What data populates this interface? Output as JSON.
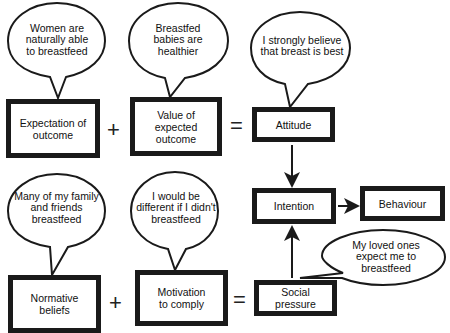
{
  "diagram": {
    "type": "theory-of-reasoned-action",
    "boxes": {
      "expectation": "Expectation of outcome",
      "value": "Value of expected outcome",
      "attitude": "Attitude",
      "intention": "Intention",
      "behaviour": "Behaviour",
      "normative": "Normative beliefs",
      "motivation": "Motivation to comply",
      "social": "Social pressure"
    },
    "bubbles": {
      "expectation": "Women are naturally able to breastfeed",
      "value": "Breastfed babies are healthier",
      "attitude": "I strongly believe that breast is best",
      "normative": "Many of my family and friends breastfeed",
      "motivation": "I would be different if I didn't breastfeed",
      "social": "My loved ones expect me to breastfeed"
    },
    "operators": {
      "plus_top": "+",
      "equals_top": "=",
      "plus_bottom": "+",
      "equals_bottom": "="
    },
    "edges": [
      {
        "from": "Attitude",
        "to": "Intention"
      },
      {
        "from": "Social pressure",
        "to": "Intention"
      },
      {
        "from": "Intention",
        "to": "Behaviour"
      }
    ],
    "colors": {
      "stroke": "#1a1a1a",
      "fill": "#ffffff"
    }
  }
}
